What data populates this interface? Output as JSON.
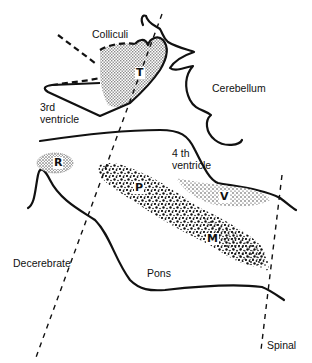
{
  "diagram": {
    "type": "anatomical-section",
    "colors": {
      "ink": "#111111",
      "background": "#ffffff",
      "stipple": "#999999"
    },
    "labels": {
      "colliculi": "Colliculi",
      "cerebellum": "Cerebellum",
      "third_ventricle_line1": "3rd",
      "third_ventricle_line2": "ventricle",
      "fourth_ventricle_line1": "4 th",
      "fourth_ventricle_line2": "ventricle",
      "decerebrate": "Decerebrate",
      "pons": "Pons",
      "spinal": "Spinal"
    },
    "region_letters": {
      "T": "T",
      "R": "R",
      "P": "P",
      "V": "V",
      "M": "M"
    },
    "cut_lines": [
      {
        "name": "Decerebrate",
        "style": "dashed"
      },
      {
        "name": "Spinal",
        "style": "dashed"
      }
    ]
  }
}
